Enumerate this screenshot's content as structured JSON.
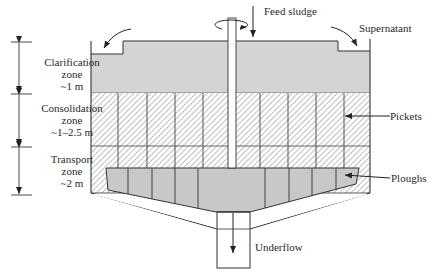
{
  "diagram": {
    "labels": {
      "feed": "Feed sludge",
      "supernatant": "Supernatant",
      "pickets": "Pickets",
      "ploughs": "Ploughs",
      "underflow": "Underflow"
    },
    "zones": [
      {
        "name": "Clarification",
        "line2": "zone",
        "depth": "~1 m"
      },
      {
        "name": "Consolidation",
        "line2": "zone",
        "depth": "~1–2.5 m"
      },
      {
        "name": "Transport",
        "line2": "zone",
        "depth": "~2 m"
      }
    ],
    "colors": {
      "liquid_fill": "#d4d4d4",
      "plough_fill": "#c8c8c8",
      "line": "#333333",
      "hatch": "#8a8a8a",
      "background": "#ffffff"
    }
  }
}
